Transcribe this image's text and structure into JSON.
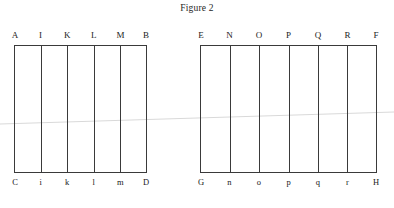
{
  "figure": {
    "title": "Figure 2",
    "background_color": "#ffffff",
    "line_color": "#3a3a3a",
    "text_color": "#1a1a1a"
  },
  "diagrams": [
    {
      "name": "left-grid",
      "columns": 5,
      "top_labels": [
        "A",
        "I",
        "K",
        "L",
        "M",
        "B"
      ],
      "bottom_labels": [
        "C",
        "i",
        "k",
        "l",
        "m",
        "D"
      ]
    },
    {
      "name": "right-grid",
      "columns": 6,
      "top_labels": [
        "E",
        "N",
        "O",
        "P",
        "Q",
        "R",
        "F"
      ],
      "bottom_labels": [
        "G",
        "n",
        "o",
        "p",
        "q",
        "r",
        "H"
      ]
    }
  ],
  "chart_data": {
    "type": "diagram",
    "title": "Figure 2",
    "panels": [
      {
        "id": "left",
        "columns": 5,
        "dividers": 4,
        "top_vertices": [
          "A",
          "I",
          "K",
          "L",
          "M",
          "B"
        ],
        "bottom_vertices": [
          "C",
          "i",
          "k",
          "l",
          "m",
          "D"
        ]
      },
      {
        "id": "right",
        "columns": 6,
        "dividers": 5,
        "top_vertices": [
          "E",
          "N",
          "O",
          "P",
          "Q",
          "R",
          "F"
        ],
        "bottom_vertices": [
          "G",
          "n",
          "o",
          "p",
          "q",
          "r",
          "H"
        ]
      }
    ]
  }
}
